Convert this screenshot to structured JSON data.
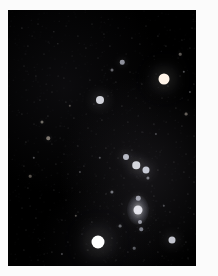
{
  "image": {
    "kind": "astrophotograph",
    "subject": "Orion constellation star field",
    "width": 218,
    "height": 276,
    "background_color": "#000000",
    "border_color": "#fbfbfb",
    "frame": {
      "left": 8,
      "top": 10,
      "width": 188,
      "height": 256
    },
    "caption": ""
  },
  "chart_data": {
    "type": "scatter",
    "xlabel": "",
    "ylabel": "",
    "xlim": [
      0,
      188
    ],
    "ylim": [
      0,
      256
    ],
    "grid": false,
    "legend": "none",
    "named_stars": [
      {
        "name": "Betelgeuse",
        "x": 156,
        "y": 69,
        "size": 11,
        "color": "#fff4e8",
        "brightness": 1.0
      },
      {
        "name": "Rigel",
        "x": 90,
        "y": 232,
        "size": 13,
        "color": "#ffffff",
        "brightness": 1.0
      },
      {
        "name": "Bellatrix",
        "x": 92,
        "y": 90,
        "size": 8,
        "color": "#f4f6ff",
        "brightness": 0.85
      },
      {
        "name": "Saiph",
        "x": 164,
        "y": 230,
        "size": 7,
        "color": "#f2f4ff",
        "brightness": 0.8
      },
      {
        "name": "Alnitak",
        "x": 138,
        "y": 160,
        "size": 7,
        "color": "#eef2ff",
        "brightness": 0.82
      },
      {
        "name": "Alnilam",
        "x": 128,
        "y": 155,
        "size": 7.5,
        "color": "#f6f8ff",
        "brightness": 0.85
      },
      {
        "name": "Mintaka",
        "x": 118,
        "y": 147,
        "size": 6,
        "color": "#eef2ff",
        "brightness": 0.75
      },
      {
        "name": "Meissa",
        "x": 114,
        "y": 52,
        "size": 4.5,
        "color": "#eaeeff",
        "brightness": 0.6
      },
      {
        "name": "Orion Nebula (M42)",
        "x": 130,
        "y": 200,
        "size": 9,
        "color": "#f0f0f8",
        "brightness": 0.9
      },
      {
        "name": "Sword upper",
        "x": 130,
        "y": 188,
        "size": 4.5,
        "color": "#eef0ff",
        "brightness": 0.62
      },
      {
        "name": "Sword lower",
        "x": 132,
        "y": 212,
        "size": 4,
        "color": "#eef0ff",
        "brightness": 0.58
      },
      {
        "name": "Nair al Saif",
        "x": 133,
        "y": 219,
        "size": 3.5,
        "color": "#e8ecff",
        "brightness": 0.5
      },
      {
        "name": "Tabit",
        "x": 40,
        "y": 128,
        "size": 3.5,
        "color": "#fff0e0",
        "brightness": 0.48
      },
      {
        "name": "Pi-3 Orionis",
        "x": 34,
        "y": 112,
        "size": 3,
        "color": "#fff6e6",
        "brightness": 0.42
      },
      {
        "name": "Eta Orionis",
        "x": 104,
        "y": 182,
        "size": 3.2,
        "color": "#eef2ff",
        "brightness": 0.45
      },
      {
        "name": "Phi-1 Orionis",
        "x": 104,
        "y": 60,
        "size": 3,
        "color": "#f0f2ff",
        "brightness": 0.4
      },
      {
        "name": "Mu Orionis",
        "x": 178,
        "y": 104,
        "size": 2.8,
        "color": "#fff2e4",
        "brightness": 0.38
      },
      {
        "name": "Chi Orionis",
        "x": 172,
        "y": 44,
        "size": 2.6,
        "color": "#fff4e8",
        "brightness": 0.35
      },
      {
        "name": "Sigma Orionis",
        "x": 140,
        "y": 168,
        "size": 3.2,
        "color": "#eef2ff",
        "brightness": 0.46
      },
      {
        "name": "Tau Orionis",
        "x": 112,
        "y": 216,
        "size": 2.8,
        "color": "#f0f4ff",
        "brightness": 0.4
      },
      {
        "name": "Upsilon Orionis",
        "x": 126,
        "y": 238,
        "size": 2.6,
        "color": "#eef2ff",
        "brightness": 0.36
      },
      {
        "name": "Omega Orionis",
        "x": 92,
        "y": 148,
        "size": 2.4,
        "color": "#f2f4ff",
        "brightness": 0.33
      },
      {
        "name": "Rho Orionis",
        "x": 62,
        "y": 96,
        "size": 2.4,
        "color": "#fff0e2",
        "brightness": 0.32
      },
      {
        "name": "Pi-6 Orionis",
        "x": 22,
        "y": 166,
        "size": 2.6,
        "color": "#ffeedc",
        "brightness": 0.34
      },
      {
        "name": "Pi-5 Orionis",
        "x": 26,
        "y": 148,
        "size": 2.4,
        "color": "#f4f4ff",
        "brightness": 0.31
      },
      {
        "name": "Nu Orionis",
        "x": 176,
        "y": 62,
        "size": 2.4,
        "color": "#f2f4ff",
        "brightness": 0.31
      },
      {
        "name": "Xi Orionis",
        "x": 182,
        "y": 82,
        "size": 2.2,
        "color": "#f2f4ff",
        "brightness": 0.29
      },
      {
        "name": "29 Orionis",
        "x": 68,
        "y": 206,
        "size": 2.4,
        "color": "#fff2e6",
        "brightness": 0.32
      },
      {
        "name": "49 Orionis",
        "x": 54,
        "y": 244,
        "size": 2.2,
        "color": "#f2f4ff",
        "brightness": 0.28
      },
      {
        "name": "Field star A",
        "x": 156,
        "y": 196,
        "size": 2.4,
        "color": "#f0f2ff",
        "brightness": 0.3
      },
      {
        "name": "Field star B",
        "x": 148,
        "y": 124,
        "size": 2.2,
        "color": "#f2f2ff",
        "brightness": 0.28
      },
      {
        "name": "Field star C",
        "x": 72,
        "y": 162,
        "size": 2.2,
        "color": "#f4f2ff",
        "brightness": 0.27
      }
    ],
    "background_stars": [
      [
        14,
        18,
        1.2,
        0.3
      ],
      [
        30,
        14,
        1.0,
        0.22
      ],
      [
        46,
        22,
        1.3,
        0.28
      ],
      [
        58,
        16,
        0.9,
        0.2
      ],
      [
        70,
        26,
        1.1,
        0.24
      ],
      [
        84,
        14,
        1.0,
        0.21
      ],
      [
        96,
        24,
        1.2,
        0.26
      ],
      [
        110,
        18,
        0.9,
        0.19
      ],
      [
        124,
        28,
        1.1,
        0.25
      ],
      [
        138,
        16,
        1.0,
        0.22
      ],
      [
        150,
        26,
        1.2,
        0.27
      ],
      [
        162,
        20,
        0.9,
        0.2
      ],
      [
        174,
        30,
        1.1,
        0.24
      ],
      [
        184,
        18,
        1.0,
        0.23
      ],
      [
        20,
        36,
        1.2,
        0.26
      ],
      [
        36,
        44,
        1.0,
        0.21
      ],
      [
        50,
        34,
        1.3,
        0.3
      ],
      [
        64,
        46,
        0.9,
        0.19
      ],
      [
        78,
        38,
        1.1,
        0.25
      ],
      [
        90,
        48,
        1.0,
        0.22
      ],
      [
        102,
        36,
        1.2,
        0.27
      ],
      [
        118,
        44,
        0.9,
        0.18
      ],
      [
        132,
        34,
        1.1,
        0.24
      ],
      [
        146,
        46,
        1.0,
        0.21
      ],
      [
        158,
        36,
        1.2,
        0.28
      ],
      [
        170,
        48,
        0.9,
        0.19
      ],
      [
        182,
        38,
        1.1,
        0.23
      ],
      [
        16,
        56,
        1.0,
        0.22
      ],
      [
        28,
        66,
        1.2,
        0.26
      ],
      [
        42,
        58,
        0.9,
        0.18
      ],
      [
        56,
        68,
        1.1,
        0.24
      ],
      [
        68,
        58,
        1.0,
        0.21
      ],
      [
        82,
        70,
        1.2,
        0.27
      ],
      [
        94,
        60,
        0.9,
        0.19
      ],
      [
        108,
        72,
        1.1,
        0.25
      ],
      [
        122,
        62,
        1.0,
        0.22
      ],
      [
        134,
        74,
        1.2,
        0.28
      ],
      [
        148,
        64,
        0.9,
        0.18
      ],
      [
        160,
        76,
        1.1,
        0.24
      ],
      [
        172,
        66,
        1.0,
        0.21
      ],
      [
        186,
        74,
        1.2,
        0.26
      ],
      [
        18,
        80,
        0.9,
        0.19
      ],
      [
        32,
        90,
        1.1,
        0.25
      ],
      [
        44,
        82,
        1.0,
        0.22
      ],
      [
        58,
        92,
        1.2,
        0.27
      ],
      [
        72,
        84,
        0.9,
        0.18
      ],
      [
        86,
        94,
        1.1,
        0.24
      ],
      [
        100,
        86,
        1.0,
        0.21
      ],
      [
        114,
        96,
        1.2,
        0.28
      ],
      [
        128,
        88,
        0.9,
        0.19
      ],
      [
        142,
        98,
        1.1,
        0.25
      ],
      [
        154,
        88,
        1.0,
        0.22
      ],
      [
        168,
        98,
        1.2,
        0.26
      ],
      [
        180,
        90,
        0.9,
        0.18
      ],
      [
        14,
        104,
        1.1,
        0.24
      ],
      [
        26,
        114,
        1.0,
        0.21
      ],
      [
        40,
        106,
        1.2,
        0.27
      ],
      [
        52,
        116,
        0.9,
        0.19
      ],
      [
        66,
        108,
        1.1,
        0.25
      ],
      [
        80,
        118,
        1.0,
        0.22
      ],
      [
        94,
        110,
        1.2,
        0.28
      ],
      [
        106,
        120,
        0.9,
        0.18
      ],
      [
        120,
        112,
        1.1,
        0.24
      ],
      [
        134,
        122,
        1.0,
        0.21
      ],
      [
        146,
        114,
        1.2,
        0.26
      ],
      [
        160,
        124,
        0.9,
        0.19
      ],
      [
        174,
        116,
        1.1,
        0.25
      ],
      [
        186,
        126,
        1.0,
        0.22
      ],
      [
        18,
        132,
        1.2,
        0.27
      ],
      [
        30,
        142,
        0.9,
        0.18
      ],
      [
        44,
        134,
        1.1,
        0.24
      ],
      [
        56,
        144,
        1.0,
        0.21
      ],
      [
        70,
        136,
        1.2,
        0.28
      ],
      [
        84,
        146,
        0.9,
        0.19
      ],
      [
        98,
        138,
        1.1,
        0.25
      ],
      [
        110,
        148,
        1.0,
        0.22
      ],
      [
        124,
        140,
        1.2,
        0.26
      ],
      [
        152,
        142,
        0.9,
        0.18
      ],
      [
        166,
        152,
        1.1,
        0.24
      ],
      [
        178,
        144,
        1.0,
        0.21
      ],
      [
        16,
        156,
        1.2,
        0.27
      ],
      [
        34,
        160,
        0.9,
        0.19
      ],
      [
        48,
        154,
        1.1,
        0.25
      ],
      [
        60,
        164,
        1.0,
        0.22
      ],
      [
        76,
        156,
        1.2,
        0.28
      ],
      [
        88,
        166,
        0.9,
        0.18
      ],
      [
        102,
        158,
        1.1,
        0.24
      ],
      [
        116,
        168,
        1.0,
        0.21
      ],
      [
        150,
        160,
        1.2,
        0.26
      ],
      [
        164,
        170,
        0.9,
        0.19
      ],
      [
        176,
        162,
        1.1,
        0.25
      ],
      [
        186,
        172,
        1.0,
        0.22
      ],
      [
        20,
        178,
        1.2,
        0.27
      ],
      [
        32,
        188,
        0.9,
        0.18
      ],
      [
        46,
        180,
        1.1,
        0.24
      ],
      [
        58,
        190,
        1.0,
        0.21
      ],
      [
        72,
        182,
        1.2,
        0.28
      ],
      [
        86,
        192,
        0.9,
        0.19
      ],
      [
        98,
        184,
        1.1,
        0.25
      ],
      [
        114,
        194,
        1.0,
        0.22
      ],
      [
        146,
        186,
        1.2,
        0.26
      ],
      [
        166,
        190,
        0.9,
        0.19
      ],
      [
        180,
        184,
        1.1,
        0.24
      ],
      [
        14,
        198,
        1.0,
        0.21
      ],
      [
        28,
        208,
        1.2,
        0.27
      ],
      [
        42,
        200,
        0.9,
        0.18
      ],
      [
        54,
        210,
        1.1,
        0.25
      ],
      [
        70,
        202,
        1.0,
        0.22
      ],
      [
        84,
        212,
        1.2,
        0.28
      ],
      [
        100,
        204,
        0.9,
        0.18
      ],
      [
        116,
        204,
        1.1,
        0.24
      ],
      [
        148,
        210,
        1.0,
        0.21
      ],
      [
        162,
        202,
        1.2,
        0.26
      ],
      [
        176,
        212,
        0.9,
        0.19
      ],
      [
        186,
        204,
        1.1,
        0.25
      ],
      [
        18,
        220,
        1.0,
        0.22
      ],
      [
        32,
        230,
        1.2,
        0.27
      ],
      [
        46,
        222,
        0.9,
        0.18
      ],
      [
        60,
        232,
        1.1,
        0.24
      ],
      [
        74,
        224,
        1.0,
        0.21
      ],
      [
        104,
        228,
        1.2,
        0.26
      ],
      [
        118,
        222,
        0.9,
        0.19
      ],
      [
        142,
        232,
        1.1,
        0.25
      ],
      [
        152,
        222,
        1.0,
        0.22
      ],
      [
        178,
        232,
        1.2,
        0.27
      ],
      [
        188,
        224,
        0.9,
        0.18
      ],
      [
        16,
        240,
        1.1,
        0.24
      ],
      [
        30,
        250,
        1.0,
        0.21
      ],
      [
        44,
        242,
        1.2,
        0.26
      ],
      [
        66,
        248,
        0.9,
        0.19
      ],
      [
        80,
        240,
        1.1,
        0.25
      ],
      [
        108,
        250,
        1.0,
        0.22
      ],
      [
        120,
        242,
        1.2,
        0.27
      ],
      [
        136,
        250,
        0.9,
        0.18
      ],
      [
        150,
        242,
        1.1,
        0.24
      ],
      [
        180,
        248,
        1.0,
        0.21
      ],
      [
        190,
        240,
        1.2,
        0.26
      ],
      [
        24,
        26,
        0.8,
        0.16
      ],
      [
        38,
        74,
        0.8,
        0.15
      ],
      [
        52,
        128,
        0.8,
        0.17
      ],
      [
        64,
        178,
        0.8,
        0.14
      ],
      [
        78,
        104,
        0.8,
        0.16
      ],
      [
        92,
        196,
        0.8,
        0.15
      ],
      [
        106,
        138,
        0.8,
        0.17
      ],
      [
        120,
        86,
        0.8,
        0.14
      ],
      [
        144,
        176,
        0.8,
        0.16
      ],
      [
        158,
        112,
        0.8,
        0.15
      ],
      [
        170,
        218,
        0.8,
        0.17
      ],
      [
        184,
        152,
        0.8,
        0.14
      ],
      [
        22,
        196,
        0.8,
        0.16
      ],
      [
        36,
        244,
        0.8,
        0.15
      ],
      [
        50,
        66,
        0.8,
        0.17
      ],
      [
        88,
        124,
        0.8,
        0.14
      ],
      [
        112,
        238,
        0.8,
        0.16
      ],
      [
        130,
        106,
        0.8,
        0.15
      ],
      [
        154,
        246,
        0.8,
        0.17
      ],
      [
        168,
        132,
        0.8,
        0.14
      ],
      [
        182,
        198,
        0.8,
        0.16
      ],
      [
        26,
        92,
        0.8,
        0.15
      ],
      [
        60,
        118,
        0.8,
        0.17
      ],
      [
        96,
        168,
        0.8,
        0.14
      ],
      [
        140,
        218,
        0.8,
        0.16
      ],
      [
        174,
        88,
        0.8,
        0.15
      ]
    ]
  }
}
